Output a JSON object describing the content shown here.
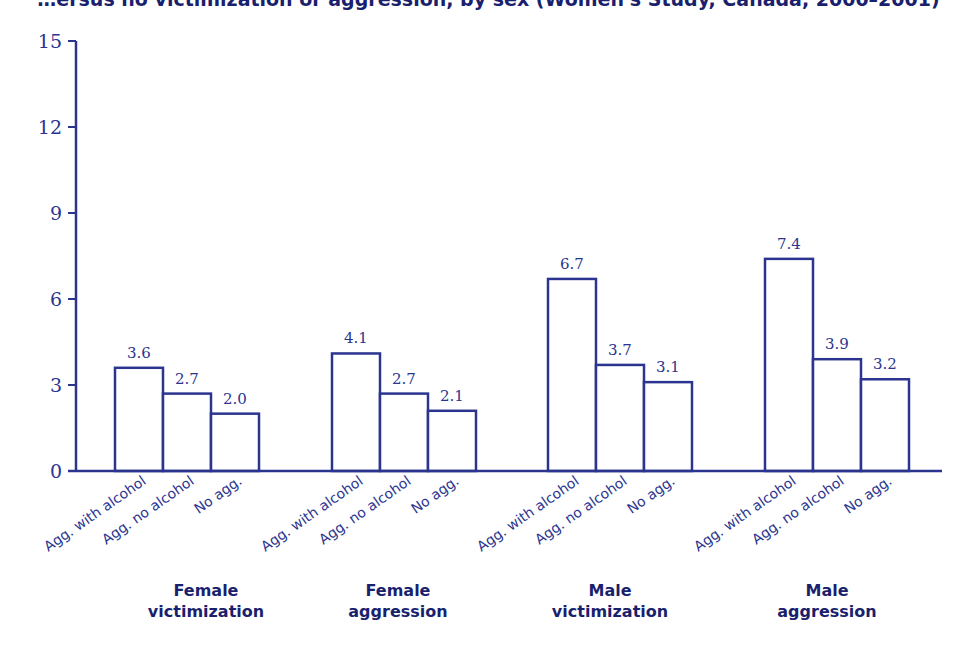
{
  "title": "…ersus no victimization or aggression, by sex (Women's Study, Canada, 2000–2001)",
  "colors": {
    "axis": "#2b3590",
    "bar_stroke": "#2b3590",
    "bar_fill": "#ffffff",
    "group_label": "#1a1f6e"
  },
  "chart_data": {
    "type": "bar",
    "title": "",
    "xlabel": "",
    "ylabel": "",
    "ylim": [
      0,
      15
    ],
    "yticks": [
      0,
      3,
      6,
      9,
      12,
      15
    ],
    "grid": false,
    "legend": null,
    "groups": [
      "Female victimization",
      "Female aggression",
      "Male victimization",
      "Male aggression"
    ],
    "categories": [
      "Agg. with alcohol",
      "Agg. no alcohol",
      "No agg."
    ],
    "series": [
      {
        "name": "Female victimization",
        "values": [
          3.6,
          2.7,
          2.0
        ]
      },
      {
        "name": "Female aggression",
        "values": [
          4.1,
          2.7,
          2.1
        ]
      },
      {
        "name": "Male victimization",
        "values": [
          6.7,
          3.7,
          3.1
        ]
      },
      {
        "name": "Male aggression",
        "values": [
          7.4,
          3.9,
          3.2
        ]
      }
    ],
    "value_labels": [
      [
        "3.6",
        "2.7",
        "2.0"
      ],
      [
        "4.1",
        "2.7",
        "2.1"
      ],
      [
        "6.7",
        "3.7",
        "3.1"
      ],
      [
        "7.4",
        "3.9",
        "3.2"
      ]
    ],
    "group_label_lines": [
      [
        "Female",
        "victimization"
      ],
      [
        "Female",
        "aggression"
      ],
      [
        "Male",
        "victimization"
      ],
      [
        "Male",
        "aggression"
      ]
    ]
  }
}
